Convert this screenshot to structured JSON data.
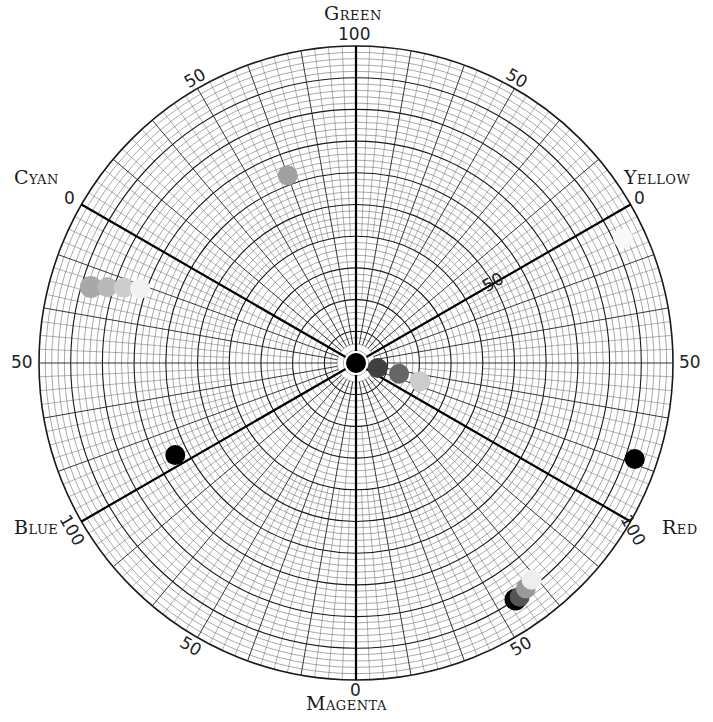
{
  "chart_data": {
    "type": "scatter",
    "subtype": "polar-color-wheel",
    "title": "",
    "center_px": [
      356,
      363
    ],
    "outer_radius_px": 317,
    "radial_range": [
      0,
      100
    ],
    "grid": true,
    "axes": [
      {
        "name": "Green",
        "angle_deg": 90,
        "end_label": "100"
      },
      {
        "name": "Yellow",
        "angle_deg": 30,
        "end_label": "0"
      },
      {
        "name": "Red",
        "angle_deg": -30,
        "end_label": "100"
      },
      {
        "name": "Magenta",
        "angle_deg": -90,
        "end_label": "0"
      },
      {
        "name": "Blue",
        "angle_deg": 210,
        "end_label": "100"
      },
      {
        "name": "Cyan",
        "angle_deg": 150,
        "end_label": "0"
      }
    ],
    "tick_labels": [
      {
        "text": "50",
        "angle_deg": 120
      },
      {
        "text": "50",
        "angle_deg": 60
      },
      {
        "text": "50",
        "angle_deg": 0
      },
      {
        "text": "50",
        "angle_deg": 180
      },
      {
        "text": "50",
        "angle_deg": -60
      },
      {
        "text": "50",
        "angle_deg": -120
      },
      {
        "text": "50",
        "angle_deg": 30,
        "inner": true
      }
    ],
    "series": [
      {
        "name": "Center",
        "points": [
          {
            "angle_deg": 0,
            "r": 0,
            "color": "#000000"
          }
        ]
      },
      {
        "name": "Neutral ramp",
        "points": [
          {
            "angle_deg": -13,
            "r": 7,
            "color": "#404040"
          },
          {
            "angle_deg": -14,
            "r": 14,
            "color": "#666666"
          },
          {
            "angle_deg": -16,
            "r": 21,
            "color": "#cccccc"
          }
        ]
      },
      {
        "name": "Cyan ramp",
        "points": [
          {
            "angle_deg": 164,
            "r": 87,
            "color": "#a8a8a8"
          },
          {
            "angle_deg": 163,
            "r": 82,
            "color": "#b8b8b8"
          },
          {
            "angle_deg": 162,
            "r": 77,
            "color": "#cdcdcd"
          },
          {
            "angle_deg": 161,
            "r": 72,
            "color": "#f2f2f2"
          }
        ]
      },
      {
        "name": "Green",
        "points": [
          {
            "angle_deg": 110,
            "r": 63,
            "color": "#a0a0a0"
          }
        ]
      },
      {
        "name": "Yellow",
        "points": [
          {
            "angle_deg": 25,
            "r": 93,
            "color": "#f8f8f8"
          }
        ]
      },
      {
        "name": "Blue",
        "points": [
          {
            "angle_deg": 207,
            "r": 64,
            "color": "#000000"
          }
        ]
      },
      {
        "name": "Red",
        "points": [
          {
            "angle_deg": -19,
            "r": 93,
            "color": "#000000"
          }
        ]
      },
      {
        "name": "Magenta ramp",
        "points": [
          {
            "angle_deg": -56,
            "r": 90,
            "color": "#000000"
          },
          {
            "angle_deg": -55,
            "r": 90,
            "color": "#555555"
          },
          {
            "angle_deg": -53,
            "r": 89,
            "color": "#999999"
          },
          {
            "angle_deg": -51,
            "r": 88,
            "color": "#eeeeee"
          }
        ]
      }
    ]
  },
  "labels": {
    "green": "Green",
    "yellow": "Yellow",
    "red": "Red",
    "magenta": "Magenta",
    "blue": "Blue",
    "cyan": "Cyan",
    "green_end": "100",
    "yellow_end": "0",
    "red_end": "100",
    "magenta_end": "0",
    "blue_end": "100",
    "cyan_end": "0",
    "fifty": "50"
  }
}
